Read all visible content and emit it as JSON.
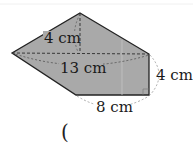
{
  "figure": {
    "shape": "pentagon",
    "fill_color": "#a9a9a9",
    "stroke_color": "#222222",
    "vertices": {
      "top": [
        80,
        13
      ],
      "left": [
        12,
        53
      ],
      "right_top": [
        149,
        54
      ],
      "right_bottom": [
        149,
        95
      ],
      "bottom_left": [
        76,
        95
      ]
    },
    "labels": {
      "height_top": "4 cm",
      "diagonal": "13 cm",
      "right_side": "4 cm",
      "bottom_side": "8 cm"
    }
  },
  "answer": {
    "open_paren": "("
  }
}
